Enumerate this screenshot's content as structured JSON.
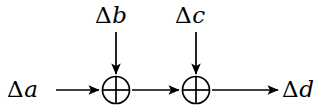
{
  "diagram": {
    "background_color": "#ffffff",
    "stroke_color": "#000000",
    "labels": {
      "input_a": {
        "delta": "Δ",
        "var": "a",
        "full": "Δa"
      },
      "input_b": {
        "delta": "Δ",
        "var": "b",
        "full": "Δb"
      },
      "input_c": {
        "delta": "Δ",
        "var": "c",
        "full": "Δc"
      },
      "output_d": {
        "delta": "Δ",
        "var": "d",
        "full": "Δd"
      }
    },
    "nodes": [
      {
        "id": "xor-1",
        "symbol": "⊕",
        "name": "xor-gate",
        "cx": 116,
        "cy": 90,
        "r": 14
      },
      {
        "id": "xor-2",
        "symbol": "⊕",
        "name": "xor-gate",
        "cx": 196,
        "cy": 90,
        "r": 14
      }
    ],
    "edges": [
      {
        "id": "edge-a-to-xor1",
        "from": "Δa",
        "to": "xor-1",
        "direction": "right"
      },
      {
        "id": "edge-b-to-xor1",
        "from": "Δb",
        "to": "xor-1",
        "direction": "down"
      },
      {
        "id": "edge-xor1-to-xor2",
        "from": "xor-1",
        "to": "xor-2",
        "direction": "right"
      },
      {
        "id": "edge-c-to-xor2",
        "from": "Δc",
        "to": "xor-2",
        "direction": "down"
      },
      {
        "id": "edge-xor2-to-d",
        "from": "xor-2",
        "to": "Δd",
        "direction": "right"
      }
    ]
  }
}
